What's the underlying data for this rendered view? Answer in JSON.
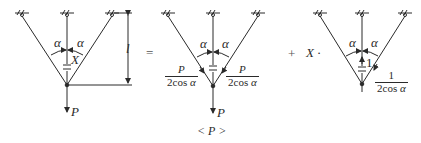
{
  "diagram": {
    "operators": {
      "equals": "=",
      "plus": "+"
    },
    "panel1": {
      "angle_left": "α",
      "angle_right": "α",
      "redundant": "X",
      "length": "l",
      "load": "P"
    },
    "panel2": {
      "angle_left": "α",
      "angle_right": "α",
      "left_force_num": "P",
      "left_force_den": "2cos",
      "left_force_den_var": "α",
      "right_force_num": "P",
      "right_force_den": "2cos",
      "right_force_den_var": "α",
      "load": "P",
      "state_label": "< P >"
    },
    "panel3": {
      "coefficient": "X ·",
      "angle_left": "α",
      "angle_right": "α",
      "unit_force": "1",
      "right_force_num": "1",
      "right_force_den": "2cos",
      "right_force_den_var": "α"
    },
    "colors": {
      "line": "#2a2a2a",
      "background": "#ffffff"
    }
  }
}
